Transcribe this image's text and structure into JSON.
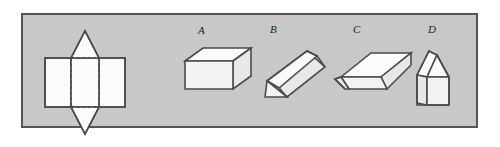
{
  "figure": {
    "frame": {
      "background_color": "#c8c8c8",
      "border_color": "#555555"
    },
    "net": {
      "name": "net-of-solid",
      "description": "Net consisting of a horizontal row of three rectangles with an isosceles triangle attached above and below the middle rectangle; fold lines shown dashed",
      "fill_color": "#fbfbfb",
      "outline_color": "#4a4a4a",
      "fold_line_style": "dashed"
    },
    "options": [
      {
        "label": "A",
        "name": "option-a-rectangular-prism",
        "description": "Rectangular prism (cuboid) drawn in oblique projection"
      },
      {
        "label": "B",
        "name": "option-b-triangular-prism",
        "description": "Triangular prism tilted diagonally"
      },
      {
        "label": "C",
        "name": "option-c-trapezoidal-prism",
        "description": "Elongated prism with trapezoidal cross-section"
      },
      {
        "label": "D",
        "name": "option-d-pentagonal-prism",
        "description": "House-shaped pentagonal prism standing upright"
      }
    ]
  }
}
